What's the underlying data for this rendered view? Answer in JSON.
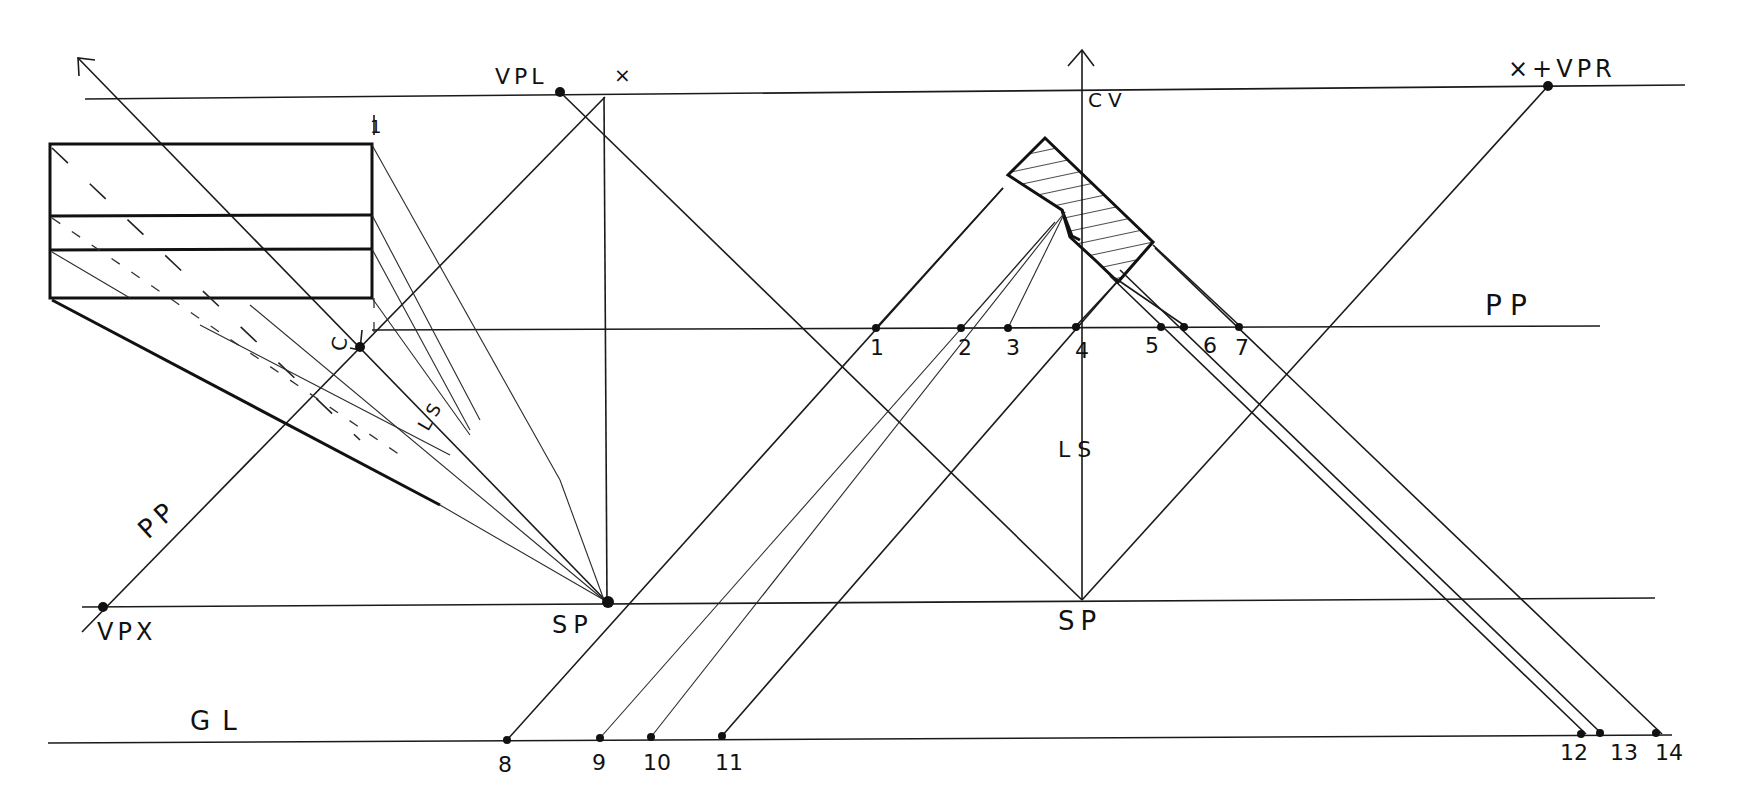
{
  "figure": {
    "type": "perspective-construction-drawing",
    "style": "hand-drawn pencil/ink on white"
  },
  "colors": {
    "ink": "#111111",
    "paper": "#ffffff"
  },
  "lines": {
    "horizon": {
      "label": "VPL / VPR horizon line"
    },
    "picture_plane": {
      "label": "PP"
    },
    "picture_plane_rotated": {
      "label": "PP"
    },
    "station_point_line": {
      "label": "SP line"
    },
    "ground_line": {
      "label": "GL"
    },
    "center_of_vision": {
      "label": "CV"
    },
    "line_of_sight": {
      "label": "LS"
    },
    "line_of_sight_small": {
      "label": "LS"
    }
  },
  "labels": {
    "vpl": "VPL",
    "vpr": "×+VPR",
    "x_mark": "×",
    "cv": "CV",
    "pp_right": "PP",
    "pp_left": "PP",
    "ls_center": "L S",
    "ls_left": "LS",
    "sp_left": "SP",
    "sp_center": "SP",
    "vpx": "VPX",
    "gl": "GL",
    "c_label": "C",
    "one_mark": "1"
  },
  "pp_points": [
    "1",
    "2",
    "3",
    "4",
    "5",
    "6",
    "7"
  ],
  "gl_points": [
    "8",
    "9",
    "10",
    "11",
    "12",
    "13",
    "14"
  ],
  "caption": ""
}
